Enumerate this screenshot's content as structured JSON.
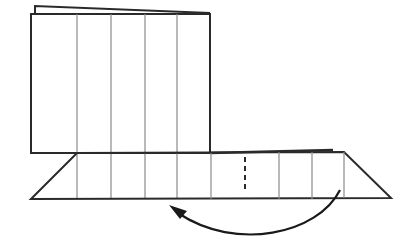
{
  "diagram": {
    "type": "origami-fold-step",
    "colors": {
      "background": "#ffffff",
      "outline": "#2a2a2a",
      "crease": "#8a8a8a",
      "arrow": "#1a1a1a"
    },
    "upper_panel": {
      "back_sheet": {
        "x1": 35,
        "y1": 6,
        "x2": 210,
        "y2": 13
      },
      "front_sheet": {
        "left": 31,
        "top": 14,
        "right": 210,
        "bottom": 152
      },
      "crease_x": [
        77,
        111,
        145,
        177
      ]
    },
    "lower_panel": {
      "top_y": 153,
      "bottom_y": 199,
      "top_left_x": 77,
      "top_right_x": 344,
      "bottom_left_x": 31,
      "bottom_right_x": 391,
      "crease_x": [
        111,
        145,
        177,
        211,
        279,
        312,
        344
      ],
      "dashed_fold_x": 245
    },
    "arrow": {
      "direction": "right-to-left",
      "meaning": "fold-over"
    }
  }
}
